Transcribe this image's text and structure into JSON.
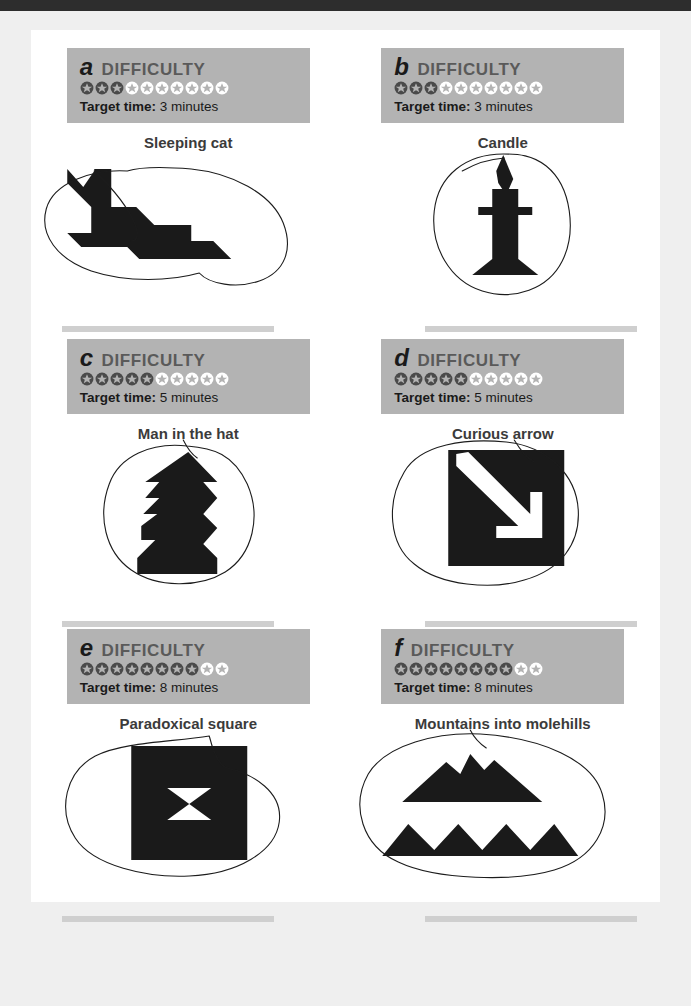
{
  "page": {
    "background_color": "#efefef",
    "sheet_color": "#ffffff",
    "top_bar_color": "#2d2d2d",
    "plaque_color": "#b3b3b3",
    "ink_color": "#1a1a1a",
    "difficulty_label": "DIFFICULTY",
    "target_time_label": "Target time:",
    "star_total": 10
  },
  "puzzles": [
    {
      "letter": "a",
      "difficulty_label": "DIFFICULTY",
      "stars_filled": 3,
      "stars_total": 10,
      "target_time_label": "Target time:",
      "target_time_value": "3 minutes",
      "caption": "Sleeping cat",
      "shape": "sleeping-cat"
    },
    {
      "letter": "b",
      "difficulty_label": "DIFFICULTY",
      "stars_filled": 3,
      "stars_total": 10,
      "target_time_label": "Target time:",
      "target_time_value": "3 minutes",
      "caption": "Candle",
      "shape": "candle"
    },
    {
      "letter": "c",
      "difficulty_label": "DIFFICULTY",
      "stars_filled": 5,
      "stars_total": 10,
      "target_time_label": "Target time:",
      "target_time_value": "5 minutes",
      "caption": "Man in the hat",
      "shape": "man-in-the-hat"
    },
    {
      "letter": "d",
      "difficulty_label": "DIFFICULTY",
      "stars_filled": 5,
      "stars_total": 10,
      "target_time_label": "Target time:",
      "target_time_value": "5 minutes",
      "caption": "Curious arrow",
      "shape": "curious-arrow"
    },
    {
      "letter": "e",
      "difficulty_label": "DIFFICULTY",
      "stars_filled": 8,
      "stars_total": 10,
      "target_time_label": "Target time:",
      "target_time_value": "8 minutes",
      "caption": "Paradoxical square",
      "shape": "paradoxical-square"
    },
    {
      "letter": "f",
      "difficulty_label": "DIFFICULTY",
      "stars_filled": 8,
      "stars_total": 10,
      "target_time_label": "Target time:",
      "target_time_value": "8 minutes",
      "caption": "Mountains into molehills",
      "shape": "mountains-into-molehills"
    }
  ]
}
